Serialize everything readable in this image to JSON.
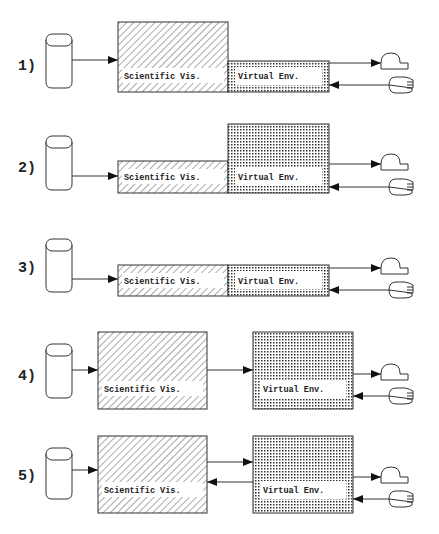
{
  "diagram": {
    "rows": [
      {
        "number": "1)",
        "sv_label": "Scientific Vis.",
        "ve_label": "Virtual Env.",
        "config": "sv-tall-ve-short-adjacent"
      },
      {
        "number": "2)",
        "sv_label": "Scientific Vis.",
        "ve_label": "Virtual Env.",
        "config": "sv-short-ve-tall-adjacent"
      },
      {
        "number": "3)",
        "sv_label": "Scientific Vis.",
        "ve_label": "Virtual Env.",
        "config": "sv-short-ve-short-adjacent"
      },
      {
        "number": "4)",
        "sv_label": "Scientific Vis.",
        "ve_label": "Virtual Env.",
        "config": "separate-one-way"
      },
      {
        "number": "5)",
        "sv_label": "Scientific Vis.",
        "ve_label": "Virtual Env.",
        "config": "separate-two-way"
      }
    ],
    "icons": {
      "data_source": "database-cylinder-icon",
      "output": "display-output-icon",
      "input": "hand-input-icon"
    },
    "colors": {
      "stroke": "#333333",
      "background": "#ffffff"
    }
  }
}
